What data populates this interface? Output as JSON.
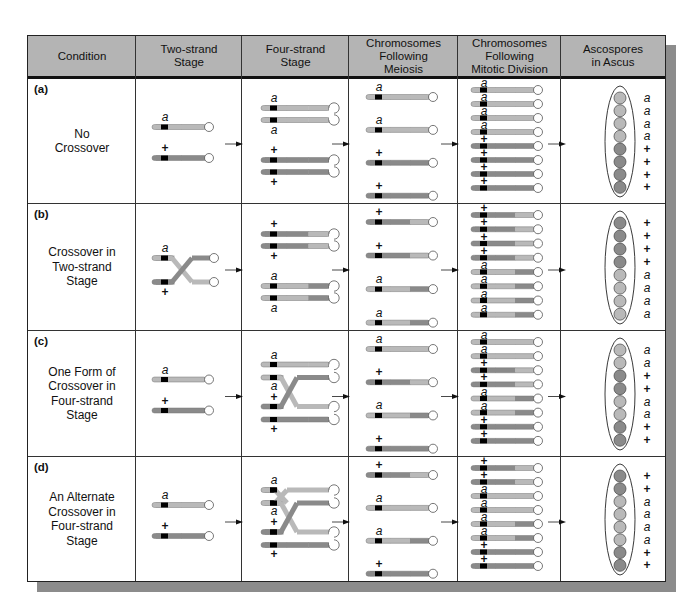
{
  "colors": {
    "a": "#b9b9b9",
    "plus": "#8a8a8a",
    "marker": "#000000",
    "header_bg": "#b4b4b4",
    "shadow": "#8c8c8c"
  },
  "header": {
    "columns": [
      "Condition",
      "Two-strand\nStage",
      "Four-strand\nStage",
      "Chromosomes\nFollowing\nMeiosis",
      "Chromosomes\nFollowing\nMitotic Division",
      "Ascospores\nin Ascus"
    ]
  },
  "rows": [
    {
      "label": "(a)",
      "condition": "No\nCrossover",
      "two_strand": {
        "type": "parallel",
        "top": "a",
        "bottom": "+"
      },
      "four_strand": {
        "type": "none",
        "labels": [
          "a",
          "a",
          "+",
          "+"
        ]
      },
      "meiosis": [
        [
          "a",
          "a",
          "a"
        ],
        [
          "a",
          "a",
          "a"
        ],
        [
          "+",
          "+",
          "+"
        ],
        [
          "+",
          "+",
          "+"
        ]
      ],
      "mitosis": [
        "a",
        "a",
        "a",
        "a",
        "+",
        "+",
        "+",
        "+"
      ],
      "mitosis_segs": [
        [
          "a",
          "a",
          "a"
        ],
        [
          "a",
          "a",
          "a"
        ],
        [
          "a",
          "a",
          "a"
        ],
        [
          "a",
          "a",
          "a"
        ],
        [
          "+",
          "+",
          "+"
        ],
        [
          "+",
          "+",
          "+"
        ],
        [
          "+",
          "+",
          "+"
        ],
        [
          "+",
          "+",
          "+"
        ]
      ],
      "ascospores": [
        "a",
        "a",
        "a",
        "a",
        "+",
        "+",
        "+",
        "+"
      ]
    },
    {
      "label": "(b)",
      "condition": "Crossover in\nTwo-strand\nStage",
      "two_strand": {
        "type": "crossed",
        "top": "a",
        "bottom": "+"
      },
      "four_strand": {
        "type": "recombined-pairs",
        "labels": [
          "+",
          "+",
          "a",
          "a"
        ]
      },
      "meiosis": [
        [
          "+",
          "+",
          "a"
        ],
        [
          "+",
          "+",
          "a"
        ],
        [
          "a",
          "a",
          "+"
        ],
        [
          "a",
          "a",
          "+"
        ]
      ],
      "mitosis": [
        "+",
        "+",
        "+",
        "+",
        "a",
        "a",
        "a",
        "a"
      ],
      "mitosis_segs": [
        [
          "+",
          "+",
          "a"
        ],
        [
          "+",
          "+",
          "a"
        ],
        [
          "+",
          "+",
          "a"
        ],
        [
          "+",
          "+",
          "a"
        ],
        [
          "a",
          "a",
          "+"
        ],
        [
          "a",
          "a",
          "+"
        ],
        [
          "a",
          "a",
          "+"
        ],
        [
          "a",
          "a",
          "+"
        ]
      ],
      "ascospores": [
        "+",
        "+",
        "+",
        "+",
        "a",
        "a",
        "a",
        "a"
      ]
    },
    {
      "label": "(c)",
      "condition": "One Form of\nCrossover in\nFour-strand\nStage",
      "two_strand": {
        "type": "parallel",
        "top": "a",
        "bottom": "+"
      },
      "four_strand": {
        "type": "one-cross",
        "labels": [
          "a",
          "a",
          "+",
          "+"
        ]
      },
      "meiosis": [
        [
          "a",
          "a",
          "a"
        ],
        [
          "+",
          "+",
          "a"
        ],
        [
          "a",
          "a",
          "+"
        ],
        [
          "+",
          "+",
          "+"
        ]
      ],
      "mitosis": [
        "a",
        "a",
        "+",
        "+",
        "a",
        "a",
        "+",
        "+"
      ],
      "mitosis_segs": [
        [
          "a",
          "a",
          "a"
        ],
        [
          "a",
          "a",
          "a"
        ],
        [
          "+",
          "+",
          "a"
        ],
        [
          "+",
          "+",
          "a"
        ],
        [
          "a",
          "a",
          "+"
        ],
        [
          "a",
          "a",
          "+"
        ],
        [
          "+",
          "+",
          "+"
        ],
        [
          "+",
          "+",
          "+"
        ]
      ],
      "ascospores": [
        "a",
        "a",
        "+",
        "+",
        "a",
        "a",
        "+",
        "+"
      ]
    },
    {
      "label": "(d)",
      "condition": "An Alternate\nCrossover in\nFour-strand\nStage",
      "two_strand": {
        "type": "parallel",
        "top": "a",
        "bottom": "+"
      },
      "four_strand": {
        "type": "double-cross",
        "labels": [
          "a",
          "a",
          "+",
          "+"
        ]
      },
      "meiosis": [
        [
          "+",
          "+",
          "a"
        ],
        [
          "a",
          "a",
          "a"
        ],
        [
          "a",
          "a",
          "+"
        ],
        [
          "+",
          "+",
          "+"
        ]
      ],
      "mitosis": [
        "+",
        "+",
        "a",
        "a",
        "a",
        "a",
        "+",
        "+"
      ],
      "mitosis_segs": [
        [
          "+",
          "+",
          "a"
        ],
        [
          "+",
          "+",
          "a"
        ],
        [
          "a",
          "a",
          "a"
        ],
        [
          "a",
          "a",
          "a"
        ],
        [
          "a",
          "a",
          "+"
        ],
        [
          "a",
          "a",
          "+"
        ],
        [
          "+",
          "+",
          "+"
        ],
        [
          "+",
          "+",
          "+"
        ]
      ],
      "ascospores": [
        "+",
        "+",
        "a",
        "a",
        "a",
        "a",
        "+",
        "+"
      ]
    }
  ]
}
